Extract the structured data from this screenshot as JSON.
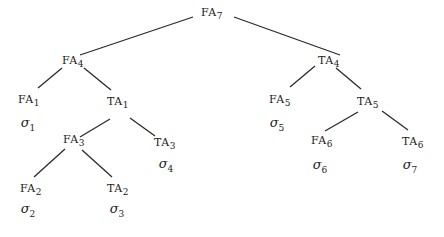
{
  "diagram": {
    "type": "tree",
    "nodes": {
      "FA7": {
        "base": "FA",
        "sub": "7"
      },
      "FA4": {
        "base": "FA",
        "sub": "4"
      },
      "TA4": {
        "base": "TA",
        "sub": "4"
      },
      "FA1": {
        "base": "FA",
        "sub": "1"
      },
      "TA1": {
        "base": "TA",
        "sub": "1"
      },
      "FA3": {
        "base": "FA",
        "sub": "3"
      },
      "TA3": {
        "base": "TA",
        "sub": "3"
      },
      "FA2": {
        "base": "FA",
        "sub": "2"
      },
      "TA2": {
        "base": "TA",
        "sub": "2"
      },
      "FA5": {
        "base": "FA",
        "sub": "5"
      },
      "TA5": {
        "base": "TA",
        "sub": "5"
      },
      "FA6": {
        "base": "FA",
        "sub": "6"
      },
      "TA6": {
        "base": "TA",
        "sub": "6"
      }
    },
    "leaves": {
      "L1": {
        "base": "σ",
        "sub": "1",
        "parent": "FA1"
      },
      "L2": {
        "base": "σ",
        "sub": "2",
        "parent": "FA2"
      },
      "L3": {
        "base": "σ",
        "sub": "3",
        "parent": "TA2"
      },
      "L4": {
        "base": "σ",
        "sub": "4",
        "parent": "TA3"
      },
      "L5": {
        "base": "σ",
        "sub": "5",
        "parent": "FA5"
      },
      "L6": {
        "base": "σ",
        "sub": "6",
        "parent": "FA6"
      },
      "L7": {
        "base": "σ",
        "sub": "7",
        "parent": "TA6"
      }
    },
    "edges": [
      [
        "FA7",
        "FA4"
      ],
      [
        "FA7",
        "TA4"
      ],
      [
        "FA4",
        "FA1"
      ],
      [
        "FA4",
        "TA1"
      ],
      [
        "TA1",
        "FA3"
      ],
      [
        "TA1",
        "TA3"
      ],
      [
        "FA3",
        "FA2"
      ],
      [
        "FA3",
        "TA2"
      ],
      [
        "TA4",
        "FA5"
      ],
      [
        "TA4",
        "TA5"
      ],
      [
        "TA5",
        "FA6"
      ],
      [
        "TA5",
        "TA6"
      ]
    ]
  }
}
